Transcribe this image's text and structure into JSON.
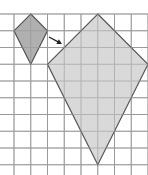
{
  "diagram": {
    "type": "geometric-dilation",
    "grid": {
      "origin_x": 14,
      "origin_y": 14,
      "cell": 16.75,
      "cols": 8,
      "rows": 9,
      "line_color": "#9a9a9a"
    },
    "shapes": [
      {
        "name": "small-kite",
        "fill": "#a9a9a9",
        "stroke": "#555555",
        "points_grid": [
          [
            1,
            0
          ],
          [
            2,
            1
          ],
          [
            1,
            3
          ],
          [
            0,
            1
          ]
        ]
      },
      {
        "name": "large-kite",
        "fill": "#d6d6d6",
        "stroke": "#555555",
        "points_grid": [
          [
            5,
            0
          ],
          [
            8,
            3
          ],
          [
            5,
            9
          ],
          [
            2,
            3
          ]
        ]
      }
    ],
    "arrow": {
      "from": [
        49,
        37
      ],
      "to": [
        62,
        44
      ],
      "color": "#222222"
    }
  }
}
